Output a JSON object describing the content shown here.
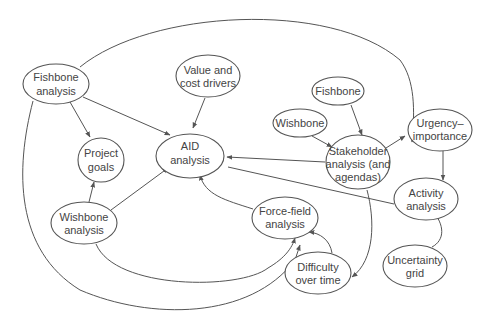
{
  "diagram": {
    "type": "directed-graph",
    "nodes": {
      "fishbone_analysis": {
        "line1": "Fishbone",
        "line2": "analysis"
      },
      "value_cost": {
        "line1": "Value and",
        "line2": "cost drivers"
      },
      "fishbone": {
        "line1": "Fishbone"
      },
      "wishbone": {
        "line1": "Wishbone"
      },
      "urgency": {
        "line1": "Urgency–",
        "line2": "importance"
      },
      "project_goals": {
        "line1": "Project",
        "line2": "goals"
      },
      "aid": {
        "line1": "AID",
        "line2": "analysis"
      },
      "stakeholder": {
        "line1": "Stakeholder",
        "line2": "analysis (and",
        "line3": "agendas)"
      },
      "activity": {
        "line1": "Activity",
        "line2": "analysis"
      },
      "wishbone_analysis": {
        "line1": "Wishbone",
        "line2": "analysis"
      },
      "forcefield": {
        "line1": "Force-field",
        "line2": "analysis"
      },
      "difficulty": {
        "line1": "Difficulty",
        "line2": "over time"
      },
      "uncertainty": {
        "line1": "Uncertainty",
        "line2": "grid"
      }
    },
    "edges": [
      {
        "from": "Fishbone analysis",
        "to": "Project goals"
      },
      {
        "from": "Fishbone analysis",
        "to": "AID analysis"
      },
      {
        "from": "Fishbone analysis",
        "to": "Stakeholder analysis (and agendas)"
      },
      {
        "from": "Fishbone analysis",
        "to": "Force-field analysis"
      },
      {
        "from": "Value and cost drivers",
        "to": "AID analysis"
      },
      {
        "from": "Fishbone",
        "to": "Stakeholder analysis (and agendas)"
      },
      {
        "from": "Wishbone",
        "to": "Stakeholder analysis (and agendas)"
      },
      {
        "from": "Stakeholder analysis (and agendas)",
        "to": "AID analysis"
      },
      {
        "from": "Stakeholder analysis (and agendas)",
        "to": "Urgency–importance"
      },
      {
        "from": "Stakeholder analysis (and agendas)",
        "to": "Difficulty over time"
      },
      {
        "from": "Urgency–importance",
        "to": "Activity analysis"
      },
      {
        "from": "Activity analysis",
        "to": "AID analysis"
      },
      {
        "from": "Uncertainty grid",
        "to": "Activity analysis"
      },
      {
        "from": "Wishbone analysis",
        "to": "Project goals"
      },
      {
        "from": "Wishbone analysis",
        "to": "AID analysis"
      },
      {
        "from": "Wishbone analysis",
        "to": "Force-field analysis"
      },
      {
        "from": "Force-field analysis",
        "to": "AID analysis"
      },
      {
        "from": "Difficulty over time",
        "to": "Force-field analysis"
      }
    ],
    "colors": {
      "stroke": "#555555",
      "text": "#444444",
      "background": "#ffffff"
    }
  }
}
